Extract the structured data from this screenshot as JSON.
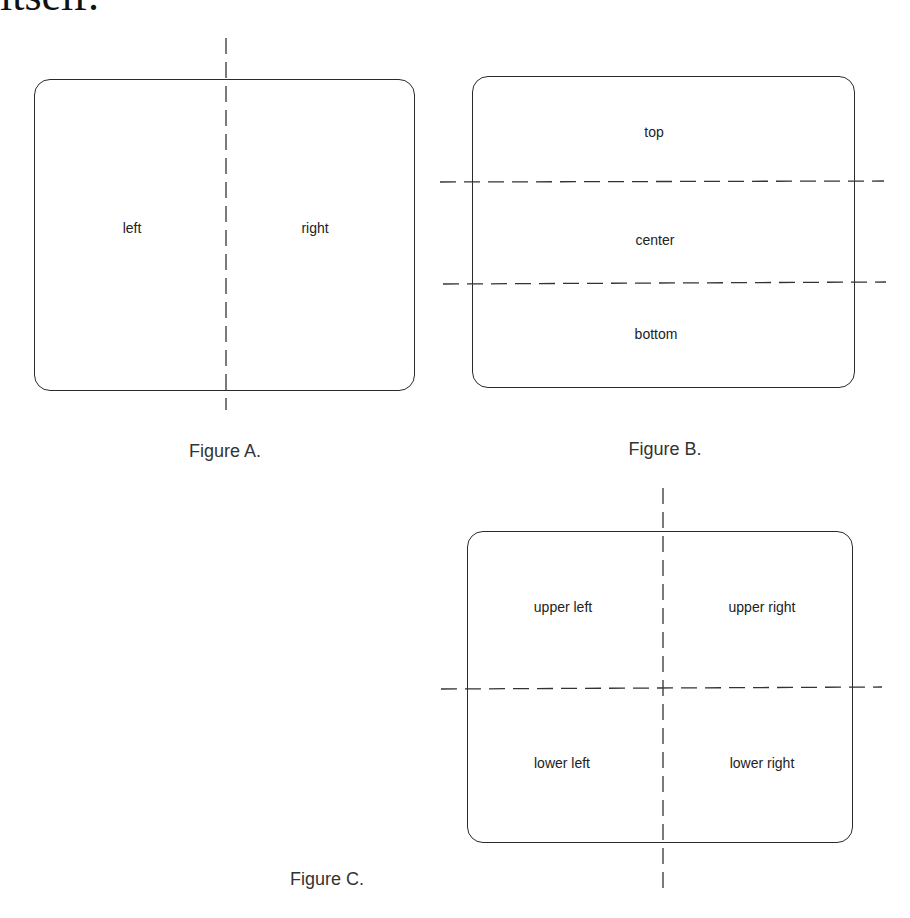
{
  "header_fragment": "itself.",
  "figures": {
    "a": {
      "caption": "Figure A.",
      "regions": {
        "left": "left",
        "right": "right"
      }
    },
    "b": {
      "caption": "Figure B.",
      "regions": {
        "top": "top",
        "center": "center",
        "bottom": "bottom"
      }
    },
    "c": {
      "caption": "Figure C.",
      "regions": {
        "upper_left": "upper left",
        "upper_right": "upper right",
        "lower_left": "lower left",
        "lower_right": "lower right"
      }
    }
  }
}
